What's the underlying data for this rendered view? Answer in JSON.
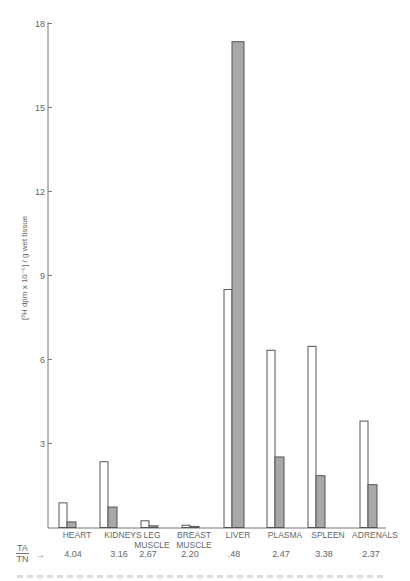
{
  "figure": {
    "y_axis_label": "[³H dpm x 10⁻⁵] / g wet tissue",
    "ratio_label_num": "TA",
    "ratio_label_den": "TN",
    "ratio_arrow": "→"
  },
  "colors": {
    "axis": "#777777",
    "bar_ta_fill": "#ffffff",
    "bar_tn_fill": "#a8a8a8",
    "bar_stroke": "#555555",
    "text": "#666666"
  },
  "chart_data": {
    "type": "bar",
    "title": "",
    "xlabel": "",
    "ylabel": "[³H dpm x 10⁻⁵] / g wet tissue",
    "ylim": [
      0,
      18
    ],
    "yticks": [
      3,
      6,
      9,
      12,
      15,
      18
    ],
    "grid": false,
    "legend": "none (open bars = TA, shaded bars = TN; ratio TA/TN shown beneath each category)",
    "categories": [
      "HEART",
      "KIDNEYS",
      "LEG MUSCLE",
      "BREAST MUSCLE",
      "LIVER",
      "PLASMA",
      "SPLEEN",
      "ADRENALS"
    ],
    "series": [
      {
        "name": "TA (open bars)",
        "values": [
          0.88,
          2.35,
          0.24,
          0.08,
          8.5,
          6.33,
          6.47,
          3.8
        ]
      },
      {
        "name": "TN (shaded bars)",
        "values": [
          0.2,
          0.73,
          0.06,
          0.04,
          17.35,
          2.52,
          1.85,
          1.53
        ]
      }
    ],
    "ratio_ta_tn": [
      "4.04",
      "3.16",
      "2.67",
      "2.20",
      ".48",
      "2.47",
      "3.38",
      "2.37"
    ],
    "annotations": [
      "TA/TN →"
    ]
  }
}
